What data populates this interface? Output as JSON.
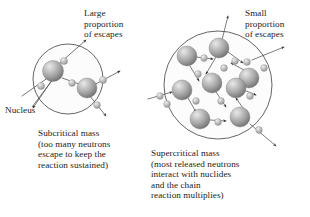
{
  "figure": {
    "background_color": "#ffffff",
    "text_color": "#1c1c1c",
    "line_color": "#3c3c3c",
    "nucleus_color": "#9b9b9b",
    "nucleus_highlight_color": "#d8d8d8",
    "nucleus_shadow_color": "#6e6e6e",
    "neutron_color": "#b4b4b4",
    "neutron_highlight_color": "#e2e2e2",
    "circle_fill_color": "#fbfbfb"
  },
  "labels": {
    "large_escapes": "Large\nproportion\nof escapes",
    "small_escapes": "Small\nproportion\nof escapes",
    "nucleus": "Nucleus"
  },
  "captions": {
    "subcritical": "Subcritical mass\n(too many neutrons\nescape to keep the\nreaction sustained)",
    "supercritical": "Supercritical mass\n(most released neutrons\ninteract with nuclides\nand the chain\nreaction multiplies)"
  },
  "diagrams": [
    {
      "id": "subcritical",
      "name": "Subcritical mass diagram",
      "boundary": {
        "cx": 68,
        "cy": 79,
        "r": 35
      },
      "nuclei": [
        {
          "cx": 53,
          "cy": 71,
          "r": 10.5
        },
        {
          "cx": 87,
          "cy": 88,
          "r": 10.0
        }
      ],
      "neutrons": [
        {
          "cx": 41,
          "cy": 86,
          "r": 3.6
        },
        {
          "cx": 64,
          "cy": 61,
          "r": 3.6
        },
        {
          "cx": 72,
          "cy": 83,
          "r": 3.4
        },
        {
          "cx": 103,
          "cy": 80,
          "r": 3.6
        },
        {
          "cx": 97,
          "cy": 105,
          "r": 3.4
        }
      ],
      "escape_count": 4,
      "interaction_count": 1
    },
    {
      "id": "supercritical",
      "name": "Supercritical mass diagram",
      "boundary": {
        "cx": 218,
        "cy": 85,
        "r": 54
      },
      "nuclei": [
        {
          "cx": 187,
          "cy": 56,
          "r": 10.0
        },
        {
          "cx": 219,
          "cy": 48,
          "r": 10.0
        },
        {
          "cx": 249,
          "cy": 78,
          "r": 10.0
        },
        {
          "cx": 182,
          "cy": 90,
          "r": 10.0
        },
        {
          "cx": 212,
          "cy": 83,
          "r": 10.0
        },
        {
          "cx": 236,
          "cy": 88,
          "r": 10.0
        },
        {
          "cx": 200,
          "cy": 119,
          "r": 10.0
        },
        {
          "cx": 240,
          "cy": 117,
          "r": 10.0
        }
      ],
      "neutrons": [
        {
          "cx": 204,
          "cy": 58,
          "r": 3.4
        },
        {
          "cx": 235,
          "cy": 61,
          "r": 3.4
        },
        {
          "cx": 198,
          "cy": 74,
          "r": 3.4
        },
        {
          "cx": 224,
          "cy": 68,
          "r": 3.4
        },
        {
          "cx": 247,
          "cy": 62,
          "r": 3.4
        },
        {
          "cx": 264,
          "cy": 68,
          "r": 3.4
        },
        {
          "cx": 167,
          "cy": 104,
          "r": 3.4
        },
        {
          "cx": 196,
          "cy": 101,
          "r": 3.4
        },
        {
          "cx": 221,
          "cy": 101,
          "r": 3.4
        },
        {
          "cx": 250,
          "cy": 96,
          "r": 3.4
        },
        {
          "cx": 160,
          "cy": 96,
          "r": 3.4
        },
        {
          "cx": 218,
          "cy": 122,
          "r": 3.4
        },
        {
          "cx": 259,
          "cy": 130,
          "r": 3.4
        }
      ],
      "escape_count": 3,
      "interaction_count": 10
    }
  ]
}
